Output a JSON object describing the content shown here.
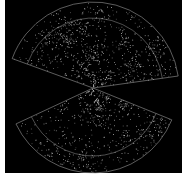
{
  "figure": {
    "type": "galaxy redshift survey wedge diagram",
    "background": "#000000",
    "page_background": "#ffffff",
    "line_color": "#9a9a9a",
    "dot_color": "#e6e6e6",
    "apex": [
      93,
      88
    ],
    "wedges": [
      {
        "name": "north-wedge",
        "start_deg": 200,
        "end_deg": 352,
        "outer_radius": 86,
        "inner_radius": 70,
        "dots": 900
      },
      {
        "name": "south-wedge",
        "start_deg": 22,
        "end_deg": 155,
        "outer_radius": 85,
        "inner_radius": 68,
        "dots": 700
      }
    ]
  }
}
